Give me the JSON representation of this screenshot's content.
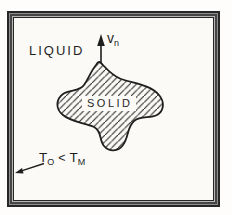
{
  "figure": {
    "labels": {
      "liquid": "LIQUID",
      "solid": "SOLID",
      "velocity": {
        "base": "v",
        "sub": "n"
      },
      "temperature": {
        "t1": "T",
        "t1_sub": "O",
        "operator": "<",
        "t2": "T",
        "t2_sub": "M"
      }
    },
    "colors": {
      "ink": "#1f1f1f",
      "paper": "#fbfaf7",
      "frame_dark": "#262626",
      "frame_light": "#b8b8b8"
    }
  }
}
